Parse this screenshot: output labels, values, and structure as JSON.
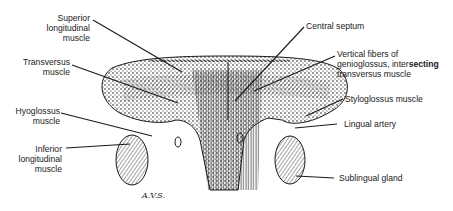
{
  "diagram": {
    "signature": "A.V.S.",
    "colors": {
      "ink": "#1a1a1a",
      "background": "#ffffff"
    },
    "labels_left": [
      {
        "id": "superior-longitudinal",
        "lines": [
          "Superior",
          "longitudinal",
          "muscle"
        ]
      },
      {
        "id": "transversus",
        "lines": [
          "Transversus",
          "muscle"
        ]
      },
      {
        "id": "hyoglossus",
        "lines": [
          "Hyoglossus",
          "muscle"
        ]
      },
      {
        "id": "inferior-longitudinal",
        "lines": [
          "Inferior",
          "longitudinal",
          "muscle"
        ]
      }
    ],
    "labels_right": [
      {
        "id": "central-septum",
        "lines": [
          "Central septum"
        ]
      },
      {
        "id": "vertical-fibers",
        "lines": [
          "Vertical fibers of",
          "genioglossus, inter",
          "transversus muscle"
        ],
        "bold_suffix": "secting"
      },
      {
        "id": "styloglossus",
        "lines": [
          "Styloglossus muscle"
        ]
      },
      {
        "id": "lingual-artery",
        "lines": [
          "Lingual artery"
        ]
      },
      {
        "id": "sublingual-gland",
        "lines": [
          "Sublingual gland"
        ]
      }
    ]
  }
}
